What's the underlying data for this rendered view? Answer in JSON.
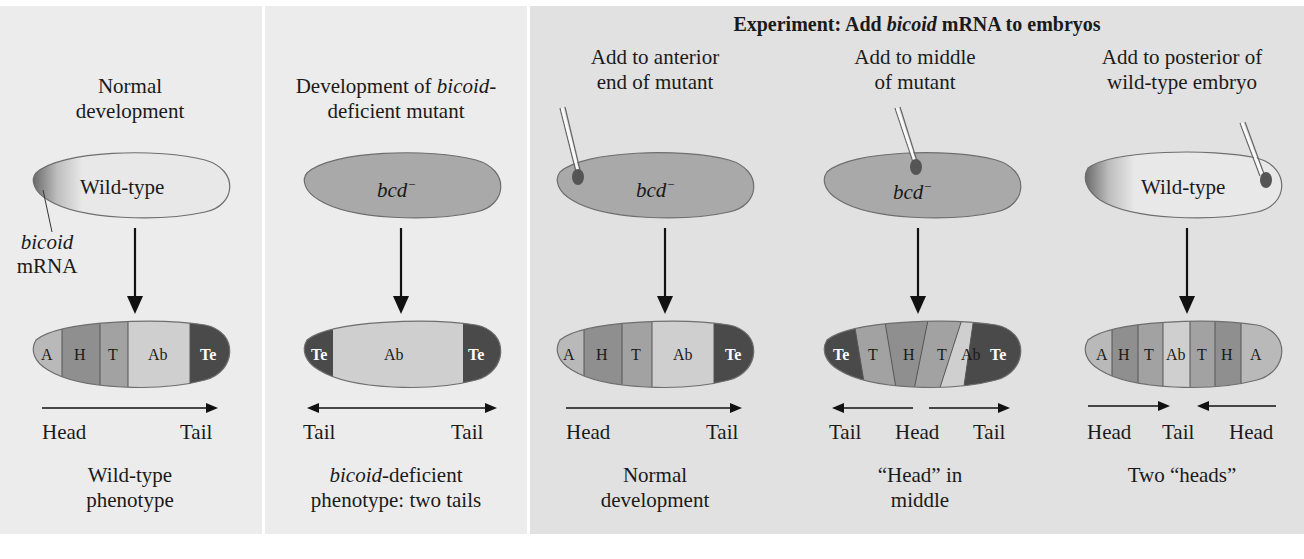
{
  "colors": {
    "panel_bg": "#ececec",
    "experiment_bg": "#e1e1e1",
    "wildtype_egg": "#e8e8e8",
    "mutant_egg": "#a9a9a9",
    "seg_A": "#b9b9b9",
    "seg_H": "#8f8f8f",
    "seg_T": "#a2a2a2",
    "seg_Ab": "#cfcfcf",
    "seg_Te": "#4a4a4a",
    "mrna_spot": "#555555"
  },
  "experiment_header": {
    "prefix": "Experiment: Add ",
    "italic": "bicoid",
    "suffix": " mRNA to embryos"
  },
  "panels": [
    {
      "id": "normal",
      "title_lines": [
        "Normal",
        "development"
      ],
      "egg_label": "Wild-type",
      "egg_type": "wild-type",
      "annotation": {
        "italic": "bicoid",
        "text": "mRNA"
      },
      "segments": [
        "A",
        "H",
        "T",
        "Ab",
        "Te"
      ],
      "axis": {
        "labels": [
          "Head",
          "Tail"
        ],
        "arrows": "right"
      },
      "result_lines": [
        "Wild-type",
        "phenotype"
      ]
    },
    {
      "id": "mutant",
      "title_line1_prefix": "Development of ",
      "title_line1_italic": "bicoid",
      "title_line1_suffix": "-",
      "title_line2": "deficient mutant",
      "egg_label": "bcd",
      "egg_label_sup": "−",
      "egg_type": "mutant",
      "segments": [
        "Te",
        "Ab",
        "Te"
      ],
      "axis": {
        "labels": [
          "Tail",
          "Tail"
        ],
        "arrows": "both"
      },
      "result_line1_italic": "bicoid",
      "result_line1_suffix": "-deficient",
      "result_line2": "phenotype: two tails"
    },
    {
      "id": "anterior",
      "title_lines": [
        "Add to anterior",
        "end of mutant"
      ],
      "egg_label": "bcd",
      "egg_label_sup": "−",
      "egg_type": "mutant",
      "injection_site": "anterior",
      "segments": [
        "A",
        "H",
        "T",
        "Ab",
        "Te"
      ],
      "axis": {
        "labels": [
          "Head",
          "Tail"
        ],
        "arrows": "right"
      },
      "result_lines": [
        "Normal",
        "development"
      ]
    },
    {
      "id": "middle",
      "title_lines": [
        "Add to middle",
        "of mutant"
      ],
      "egg_label": "bcd",
      "egg_label_sup": "−",
      "egg_type": "mutant",
      "injection_site": "middle",
      "segments": [
        "Te",
        "T",
        "H",
        "T",
        "Ab",
        "Te"
      ],
      "axis": {
        "labels": [
          "Tail",
          "Head",
          "Tail"
        ],
        "arrows": "outward"
      },
      "result_lines": [
        "“Head” in",
        "middle"
      ]
    },
    {
      "id": "posterior",
      "title_lines": [
        "Add to posterior of",
        "wild-type embryo"
      ],
      "egg_label": "Wild-type",
      "egg_type": "wild-type",
      "injection_site": "posterior",
      "segments": [
        "A",
        "H",
        "T",
        "Ab",
        "T",
        "H",
        "A"
      ],
      "axis": {
        "labels": [
          "Head",
          "Tail",
          "Head"
        ],
        "arrows": "inward"
      },
      "result_lines": [
        "Two “heads”"
      ]
    }
  ]
}
